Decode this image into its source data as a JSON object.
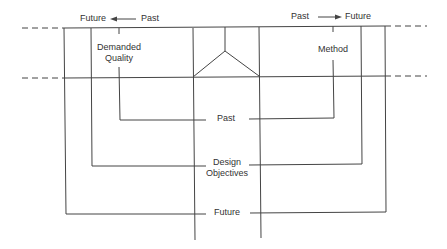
{
  "diagram": {
    "type": "time-axis-diagram",
    "colors": {
      "line": "#444444",
      "text": "#333333",
      "background": "#ffffff"
    },
    "header_left": {
      "from": "Past",
      "to": "Future",
      "direction": "right-to-left",
      "arrow": "left-arrow"
    },
    "header_right": {
      "from": "Past",
      "to": "Future",
      "direction": "left-to-right",
      "arrow": "right-arrow"
    },
    "labels": {
      "demanded_quality_line1": "Demanded",
      "demanded_quality_line2": "Quality",
      "method": "Method",
      "past": "Past",
      "design_objectives_line1": "Design",
      "design_objectives_line2": "Objectives",
      "future": "Future"
    },
    "header_text": {
      "left_future": "Future",
      "left_past": "Past",
      "right_past": "Past",
      "right_future": "Future"
    }
  }
}
